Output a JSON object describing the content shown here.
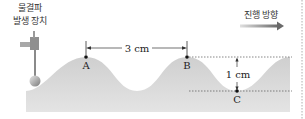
{
  "device": {
    "label_line1": "물결파",
    "label_line2": "발생 장치"
  },
  "points": {
    "a": "A",
    "b": "B",
    "c": "C"
  },
  "wavelength_label": "3 cm",
  "amplitude_label": "1 cm",
  "direction_label": "진행 방향",
  "colors": {
    "water": "#d4d4d4",
    "arrow": "#7a7a7a",
    "dashed": "#555555"
  }
}
